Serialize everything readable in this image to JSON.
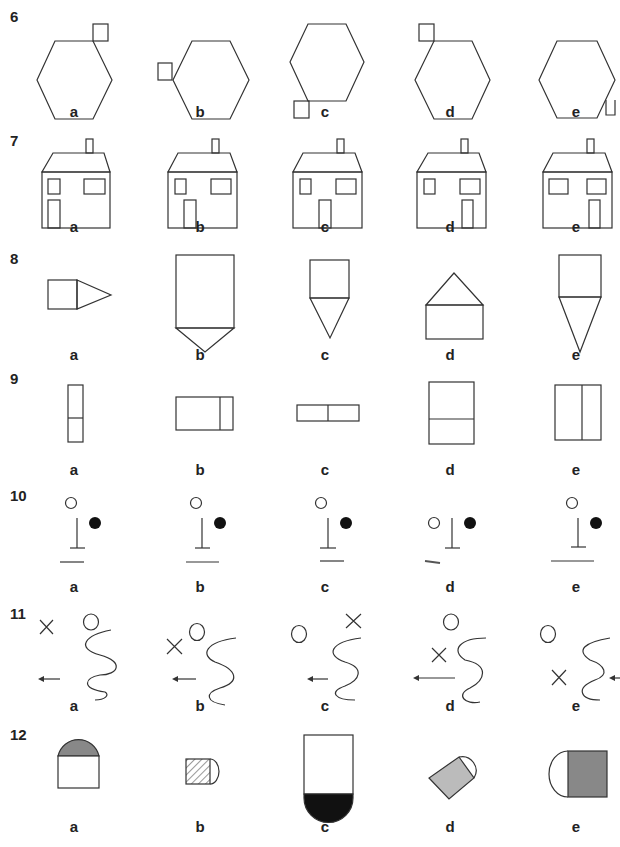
{
  "questions": [
    {
      "number": "6",
      "options": [
        "a",
        "b",
        "c",
        "d",
        "e"
      ],
      "figure": "hexagon with small square at a vertex"
    },
    {
      "number": "7",
      "options": [
        "a",
        "b",
        "c",
        "d",
        "e"
      ],
      "figure": "house with chimney, windows and door"
    },
    {
      "number": "8",
      "options": [
        "a",
        "b",
        "c",
        "d",
        "e"
      ],
      "figure": "rectangle combined with triangle"
    },
    {
      "number": "9",
      "options": [
        "a",
        "b",
        "c",
        "d",
        "e"
      ],
      "figure": "rectangle divided by a line"
    },
    {
      "number": "10",
      "options": [
        "a",
        "b",
        "c",
        "d",
        "e"
      ],
      "figure": "T-post with open and filled circles and base line"
    },
    {
      "number": "11",
      "options": [
        "a",
        "b",
        "c",
        "d",
        "e"
      ],
      "figure": "wavy line with circle, cross and arrow"
    },
    {
      "number": "12",
      "options": [
        "a",
        "b",
        "c",
        "d",
        "e"
      ],
      "figure": "rectangle with semicircle, shaded parts"
    }
  ],
  "colors": {
    "stroke": "#333333",
    "grey_fill": "#888888",
    "light_grey_fill": "#bbbbbb",
    "dark_fill": "#111111"
  }
}
